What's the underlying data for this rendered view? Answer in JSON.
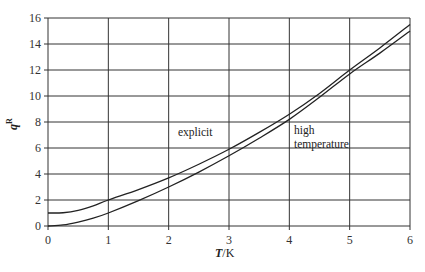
{
  "chart_data": {
    "type": "line",
    "title": "",
    "xlabel": "T/K",
    "ylabel": "q^R",
    "xlim": [
      0,
      6
    ],
    "ylim": [
      0,
      16
    ],
    "grid": true,
    "xticks": [
      0,
      1,
      2,
      3,
      4,
      5,
      6
    ],
    "yticks": [
      0,
      2,
      4,
      6,
      8,
      10,
      12,
      14,
      16
    ],
    "series": [
      {
        "name": "explicit",
        "x": [
          0,
          0.25,
          0.5,
          0.75,
          1,
          1.5,
          2,
          2.5,
          3,
          3.5,
          4,
          4.5,
          5,
          5.5,
          6
        ],
        "values": [
          1.0,
          1.02,
          1.2,
          1.55,
          2.0,
          2.8,
          3.7,
          4.75,
          5.9,
          7.2,
          8.6,
          10.2,
          12.0,
          13.7,
          15.5
        ]
      },
      {
        "name": "high temperature",
        "x": [
          0,
          0.25,
          0.5,
          0.75,
          1,
          1.5,
          2,
          2.5,
          3,
          3.5,
          4,
          4.5,
          5,
          5.5,
          6
        ],
        "values": [
          0.0,
          0.08,
          0.3,
          0.6,
          1.0,
          1.95,
          3.0,
          4.15,
          5.4,
          6.75,
          8.2,
          9.9,
          11.7,
          13.3,
          15.0
        ]
      }
    ],
    "annotations": [
      {
        "text": "explicit",
        "x": 2.15,
        "y": 6.9
      },
      {
        "text": "high",
        "x": 4.05,
        "y": 7.0
      },
      {
        "text": "temperature",
        "x": 4.05,
        "y": 5.9
      }
    ]
  },
  "labels": {
    "xlabel_italic": "T",
    "xlabel_unit": "/K",
    "ylabel_base": "q",
    "ylabel_sup": "R",
    "annotation_explicit": "explicit",
    "annotation_high": "high",
    "annotation_temperature": "temperature"
  },
  "colors": {
    "grid": "#333333",
    "curve": "#222222"
  }
}
